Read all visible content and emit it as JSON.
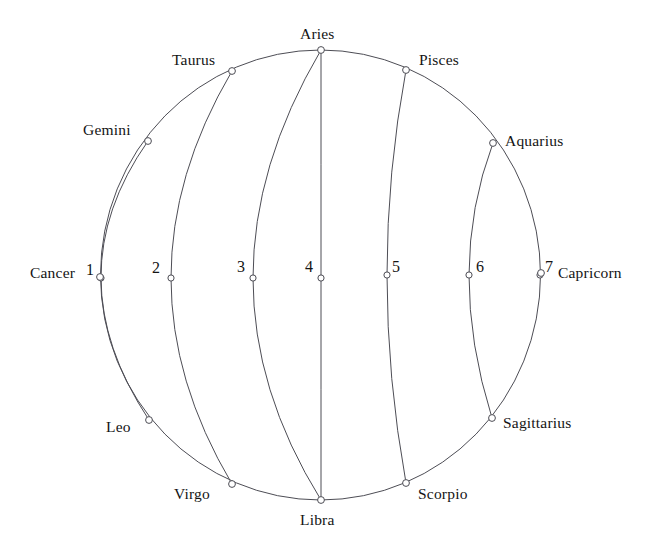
{
  "figure": {
    "kind": "celestial-sphere-zodiac-diagram",
    "background_color": "#ffffff",
    "stroke_color": "#4d4d55",
    "marker_fill": "#ffffff",
    "text_color": "#141414"
  },
  "chart_data": {
    "type": "scatter",
    "title": "",
    "subtitle": "",
    "xlabel": "",
    "ylabel": "",
    "grid": false,
    "legend": "none",
    "geometry": {
      "center_x": 320.5,
      "center_y": 275,
      "radius_x": 220,
      "radius_y": 225,
      "outer_ellipse": true,
      "equator_y": 277
    },
    "annotations": [
      "Twelve zodiac signs placed around the ecliptic circle",
      "Seven meridian arcs numbered 1 to 7 crossing the horizontal equator line"
    ],
    "zodiac_points": [
      {
        "label": "Aries",
        "angle_deg": 90,
        "x": 321,
        "y": 50,
        "label_x": 300,
        "label_y": 26,
        "label_align": "left"
      },
      {
        "label": "Taurus",
        "angle_deg": 118,
        "x": 232,
        "y": 71,
        "label_x": 172,
        "label_y": 52,
        "label_align": "left"
      },
      {
        "label": "Gemini",
        "angle_deg": 148,
        "x": 148,
        "y": 141,
        "label_x": 83,
        "label_y": 122,
        "label_align": "left"
      },
      {
        "label": "Cancer",
        "angle_deg": 180,
        "x": 100,
        "y": 277,
        "label_x": 30,
        "label_y": 265,
        "label_align": "left"
      },
      {
        "label": "Leo",
        "angle_deg": 212,
        "x": 149,
        "y": 420,
        "label_x": 106,
        "label_y": 419,
        "label_align": "left"
      },
      {
        "label": "Virgo",
        "angle_deg": 242,
        "x": 232,
        "y": 484,
        "label_x": 174,
        "label_y": 486,
        "label_align": "left"
      },
      {
        "label": "Libra",
        "angle_deg": 270,
        "x": 321,
        "y": 500,
        "label_x": 300,
        "label_y": 512,
        "label_align": "left"
      },
      {
        "label": "Scorpio",
        "angle_deg": 298,
        "x": 406,
        "y": 483,
        "label_x": 418,
        "label_y": 486,
        "label_align": "left"
      },
      {
        "label": "Sagittarius",
        "angle_deg": 328,
        "x": 492,
        "y": 418,
        "label_x": 503,
        "label_y": 415,
        "label_align": "left"
      },
      {
        "label": "Capricorn",
        "angle_deg": 0,
        "x": 541,
        "y": 273,
        "label_x": 558,
        "label_y": 265,
        "label_align": "left"
      },
      {
        "label": "Aquarius",
        "angle_deg": 32,
        "x": 493,
        "y": 143,
        "label_x": 505,
        "label_y": 133,
        "label_align": "left"
      },
      {
        "label": "Pisces",
        "angle_deg": 62,
        "x": 406,
        "y": 70,
        "label_x": 419,
        "label_y": 52,
        "label_align": "left"
      }
    ],
    "meridians": [
      {
        "number": "1",
        "top_x": 148,
        "top_y": 141,
        "bottom_x": 149,
        "bottom_y": 420,
        "equator_x": 101,
        "equator_y": 278,
        "label_x": 86,
        "label_y": 262
      },
      {
        "number": "2",
        "top_x": 232,
        "top_y": 71,
        "bottom_x": 232,
        "bottom_y": 484,
        "equator_x": 171,
        "equator_y": 278,
        "label_x": 152,
        "label_y": 260
      },
      {
        "number": "3",
        "top_x": 321,
        "top_y": 50,
        "bottom_x": 321,
        "bottom_y": 500,
        "equator_x": 253,
        "equator_y": 278,
        "label_x": 237,
        "label_y": 259
      },
      {
        "number": "4",
        "top_x": 321,
        "top_y": 50,
        "bottom_x": 321,
        "bottom_y": 500,
        "equator_x": 321,
        "equator_y": 278,
        "label_x": 305,
        "label_y": 259
      },
      {
        "number": "5",
        "top_x": 406,
        "top_y": 70,
        "bottom_x": 406,
        "bottom_y": 483,
        "equator_x": 387,
        "equator_y": 275,
        "label_x": 392,
        "label_y": 259
      },
      {
        "number": "6",
        "top_x": 493,
        "top_y": 143,
        "bottom_x": 492,
        "bottom_y": 418,
        "equator_x": 469,
        "equator_y": 275,
        "label_x": 476,
        "label_y": 259
      },
      {
        "number": "7",
        "top_x": 541,
        "top_y": 273,
        "bottom_x": 541,
        "bottom_y": 273,
        "equator_x": 540,
        "equator_y": 275,
        "label_x": 545,
        "label_y": 259
      }
    ]
  }
}
